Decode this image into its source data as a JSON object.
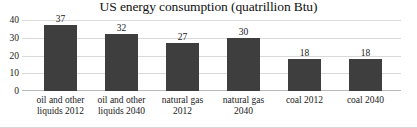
{
  "chart_data": {
    "type": "bar",
    "title": "US energy consumption (quatrillion Btu)",
    "xlabel": "",
    "ylabel": "",
    "categories": [
      "oil and other liquids 2012",
      "oil and other liquids 2040",
      "natural gas 2012",
      "natural gas 2040",
      "coal 2012",
      "coal 2040"
    ],
    "values": [
      37,
      32,
      27,
      30,
      18,
      18
    ],
    "value_labels": [
      "37",
      "32",
      "27",
      "30",
      "18",
      "18"
    ],
    "ylim": [
      0,
      40
    ],
    "yticks": [
      0,
      10,
      20,
      30,
      40
    ],
    "ytick_labels": [
      "0",
      "10",
      "20",
      "30",
      "40"
    ],
    "grid": true,
    "legend": false,
    "bar_color": "#3e3e3e",
    "gridline_color": "#d9d9d9",
    "background_color": "#ffffff"
  }
}
